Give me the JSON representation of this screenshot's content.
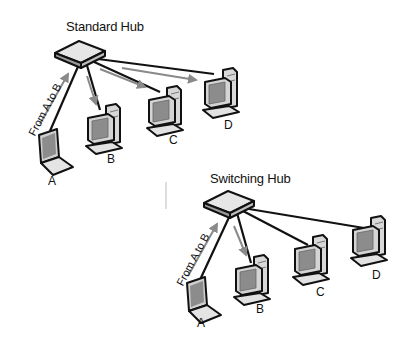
{
  "diagrams": [
    {
      "title": "Standard Hub",
      "flow_label": "From A to B",
      "nodes": [
        "A",
        "B",
        "C",
        "D"
      ]
    },
    {
      "title": "Switching Hub",
      "flow_label": "From A to B",
      "nodes": [
        "A",
        "B",
        "C",
        "D"
      ]
    }
  ],
  "colors": {
    "cable": "#111111",
    "arrow": "#8a8a8a",
    "device_fill": "#d8d8d8",
    "device_dark": "#9a9a9a",
    "screen": "#8c8c8c"
  }
}
